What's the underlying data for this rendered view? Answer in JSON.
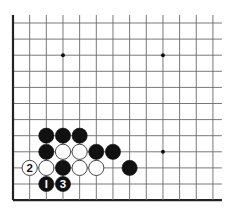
{
  "diagram": {
    "type": "go-board-corner",
    "corner": "bottom-left",
    "grid": {
      "columns": 13,
      "rows": 12,
      "origin_x": 13,
      "origin_y": 23,
      "spacing_x": 16.66,
      "spacing_y": 16.1,
      "open_right_extend": 9,
      "open_top_extend": 8,
      "line_color": "#6a6a6a",
      "border_color": "#222222"
    },
    "star_points": [
      {
        "col": 3,
        "row": 2
      },
      {
        "col": 9,
        "row": 2
      },
      {
        "col": 9,
        "row": 8
      }
    ],
    "stones": [
      {
        "color": "black",
        "col": 2,
        "row": 7,
        "label": ""
      },
      {
        "color": "black",
        "col": 3,
        "row": 7,
        "label": ""
      },
      {
        "color": "black",
        "col": 4,
        "row": 7,
        "label": ""
      },
      {
        "color": "black",
        "col": 2,
        "row": 8,
        "label": ""
      },
      {
        "color": "white",
        "col": 3,
        "row": 8,
        "label": ""
      },
      {
        "color": "white",
        "col": 4,
        "row": 8,
        "label": ""
      },
      {
        "color": "black",
        "col": 5,
        "row": 8,
        "label": ""
      },
      {
        "color": "black",
        "col": 6,
        "row": 8,
        "label": ""
      },
      {
        "color": "white",
        "col": 1,
        "row": 9,
        "label": "2"
      },
      {
        "color": "white",
        "col": 2,
        "row": 9,
        "label": ""
      },
      {
        "color": "black",
        "col": 3,
        "row": 9,
        "label": ""
      },
      {
        "color": "white",
        "col": 4,
        "row": 9,
        "label": ""
      },
      {
        "color": "white",
        "col": 5,
        "row": 9,
        "label": ""
      },
      {
        "color": "black",
        "col": 7,
        "row": 9,
        "label": ""
      },
      {
        "color": "black",
        "col": 2,
        "row": 10,
        "label": "1"
      },
      {
        "color": "black",
        "col": 3,
        "row": 10,
        "label": "3"
      }
    ],
    "colors": {
      "black_stone": "#111111",
      "white_stone": "#ffffff",
      "white_stone_outline": "#333333",
      "label_on_black": "#ffffff",
      "label_on_white": "#111111"
    }
  }
}
